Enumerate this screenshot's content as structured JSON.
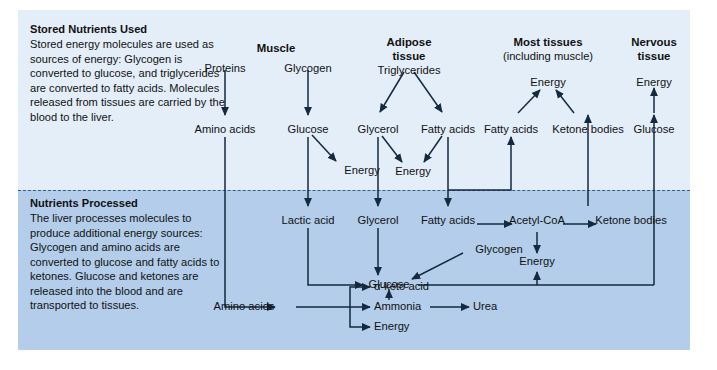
{
  "figure": {
    "bands": {
      "top_label": "Stored Nutrients Used",
      "bottom_label": "Nutrients Processed",
      "top_color": "#e4eef8",
      "bottom_color": "#b3cdea",
      "divider_color": "#2d5f8f"
    },
    "panels": [
      {
        "title": "Stored Nutrients Used",
        "body": "Stored energy molecules are used as sources of energy: Glycogen is converted to glucose, and triglycerides are converted to fatty acids. Molecules released from tissues are carried by the blood to the liver."
      },
      {
        "title": "Nutrients Processed",
        "body": "The liver processes molecules to produce additional energy sources: Glycogen and amino acids are converted to glucose and fatty acids to ketones. Glucose and ketones are released into the blood and are transported to tissues."
      }
    ],
    "column_headers": [
      {
        "line1": "Muscle",
        "line2": ""
      },
      {
        "line1": "Adipose",
        "line2": "tissue"
      },
      {
        "line1": "Most tissues",
        "line2": "(including muscle)"
      },
      {
        "line1": "Nervous",
        "line2": "tissue"
      }
    ],
    "nodes": {
      "muscle_proteins": "Proteins",
      "muscle_glycogen": "Glycogen",
      "muscle_amino_acids": "Amino acids",
      "muscle_glucose": "Glucose",
      "muscle_energy": "Energy",
      "adipose_triglycerides": "Triglycerides",
      "adipose_glycerol": "Glycerol",
      "adipose_fatty_acids": "Fatty acids",
      "adipose_energy": "Energy",
      "most_energy": "Energy",
      "most_fatty_acids": "Fatty acids",
      "most_ketone_bodies": "Ketone bodies",
      "nervous_energy": "Energy",
      "nervous_glucose": "Glucose",
      "liver_lactic_acid": "Lactic acid",
      "liver_glycerol": "Glycerol",
      "liver_fatty_acids": "Fatty acids",
      "liver_acetyl_coa": "Acetyl-CoA",
      "liver_ketone_bodies": "Ketone bodies",
      "liver_glycogen": "Glycogen",
      "liver_glucose": "Glucose",
      "liver_energy": "Energy",
      "liver_amino_acids": "Amino acids",
      "liver_keto_acid": "α-keto acid",
      "liver_ammonia": "Ammonia",
      "liver_urea": "Urea",
      "liver_energy2": "Energy"
    }
  }
}
